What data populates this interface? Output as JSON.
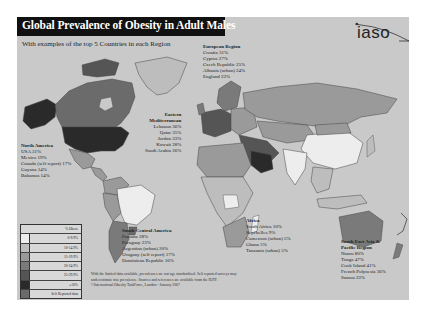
{
  "header": {
    "title": "Global Prevalence of Obesity in Adult Males",
    "subtitle": "With examples of the top 5 Countries in each Region",
    "logo": "iaso"
  },
  "regions": {
    "europe": {
      "name": "European Region",
      "items": [
        "Croatia 31%",
        "Cyprus 27%",
        "Czech Republic 25%",
        "Albania (urban) 24%",
        "England 23%"
      ]
    },
    "eastern_mediterranean": {
      "name_line1": "Eastern",
      "name_line2": "Mediterranean",
      "items": [
        "Lebanon 36%",
        "Qatar 35%",
        "Jordan 33%",
        "Kuwait 28%",
        "Saudi Arabia 26%"
      ]
    },
    "north_america": {
      "name": "North America",
      "items": [
        "USA 31%",
        "Mexico 19%",
        "Canada (self report) 17%",
        "Guyana 14%",
        "Bahamas 14%"
      ]
    },
    "south_central_america": {
      "name": "South Central America",
      "items": [
        "Panama 28%",
        "Paraguay 23%",
        "Argentina (urban) 20%",
        "Uruguay (self report) 17%",
        "Dominican Republic 16%"
      ]
    },
    "africa": {
      "name": "Africa",
      "items": [
        "South Africa 10%",
        "Seychelles 9%",
        "Cameroon (urban) 5%",
        "Ghana 5%",
        "Tanzania (urban) 5%"
      ]
    },
    "sea_pacific": {
      "name_line1": "South East Asia &",
      "name_line2": "Pacific Region",
      "items": [
        "Nauru 80%",
        "Tonga 47%",
        "Cook Island 41%",
        "French Polynesia 36%",
        "Samoa 33%"
      ]
    }
  },
  "legend": {
    "title": "% Obese",
    "items": [
      {
        "label": "0-9.9%",
        "color": "#ededed"
      },
      {
        "label": "10-14.9%",
        "color": "#bdbdbd"
      },
      {
        "label": "15-19.9%",
        "color": "#9a9a9a"
      },
      {
        "label": "20-24.9%",
        "color": "#7a7a7a"
      },
      {
        "label": "25-29.9%",
        "color": "#555555"
      },
      {
        "label": "≥30%",
        "color": "#2a2a2a"
      },
      {
        "label": "Self Reported data",
        "color": "#6b6b6b"
      }
    ]
  },
  "footnote": {
    "line1": "With the limited data available, prevalences are not age standardised. Self reported surveys may",
    "line2": "underestimate true prevalence. Sources and references are available from the IOTF.",
    "line3": "©International Obesity TaskForce, London - January 2007"
  },
  "colors": {
    "background": "#c9c9c9",
    "title_bar": "#111111",
    "ocean": "#c9c9c9"
  }
}
